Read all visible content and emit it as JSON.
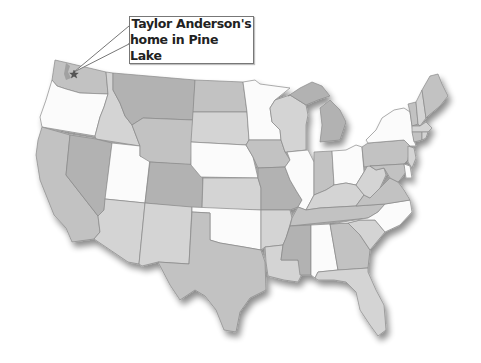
{
  "map": {
    "title": "United States",
    "callout": {
      "line1": "Taylor Anderson's",
      "line2": "home in Pine Lake"
    },
    "marker": {
      "icon": "star-icon",
      "state": "Washington",
      "place": "Pine Lake"
    },
    "shades": {
      "white": "#fbfbfb",
      "light": "#d4d4d4",
      "mid": "#c2c2c2",
      "dark": "#b2b2b2",
      "border": "#8a8a8a"
    },
    "states": [
      {
        "name": "Washington",
        "shade": "mid"
      },
      {
        "name": "Oregon",
        "shade": "white"
      },
      {
        "name": "California",
        "shade": "mid"
      },
      {
        "name": "Idaho",
        "shade": "light"
      },
      {
        "name": "Nevada",
        "shade": "dark"
      },
      {
        "name": "Utah",
        "shade": "white"
      },
      {
        "name": "Arizona",
        "shade": "light"
      },
      {
        "name": "Montana",
        "shade": "dark"
      },
      {
        "name": "Wyoming",
        "shade": "mid"
      },
      {
        "name": "Colorado",
        "shade": "dark"
      },
      {
        "name": "New Mexico",
        "shade": "light"
      },
      {
        "name": "North Dakota",
        "shade": "mid"
      },
      {
        "name": "South Dakota",
        "shade": "light"
      },
      {
        "name": "Nebraska",
        "shade": "white"
      },
      {
        "name": "Kansas",
        "shade": "light"
      },
      {
        "name": "Oklahoma",
        "shade": "white"
      },
      {
        "name": "Texas",
        "shade": "mid"
      },
      {
        "name": "Minnesota",
        "shade": "white"
      },
      {
        "name": "Iowa",
        "shade": "mid"
      },
      {
        "name": "Missouri",
        "shade": "dark"
      },
      {
        "name": "Arkansas",
        "shade": "light"
      },
      {
        "name": "Louisiana",
        "shade": "light"
      },
      {
        "name": "Wisconsin",
        "shade": "light"
      },
      {
        "name": "Illinois",
        "shade": "white"
      },
      {
        "name": "Michigan",
        "shade": "dark"
      },
      {
        "name": "Indiana",
        "shade": "mid"
      },
      {
        "name": "Ohio",
        "shade": "white"
      },
      {
        "name": "Kentucky",
        "shade": "light"
      },
      {
        "name": "Tennessee",
        "shade": "mid"
      },
      {
        "name": "Mississippi",
        "shade": "dark"
      },
      {
        "name": "Alabama",
        "shade": "white"
      },
      {
        "name": "Georgia",
        "shade": "mid"
      },
      {
        "name": "Florida",
        "shade": "light"
      },
      {
        "name": "South Carolina",
        "shade": "light"
      },
      {
        "name": "North Carolina",
        "shade": "white"
      },
      {
        "name": "Virginia",
        "shade": "mid"
      },
      {
        "name": "West Virginia",
        "shade": "light"
      },
      {
        "name": "Pennsylvania",
        "shade": "mid"
      },
      {
        "name": "New York",
        "shade": "white"
      },
      {
        "name": "Vermont",
        "shade": "mid"
      },
      {
        "name": "New Hampshire",
        "shade": "light"
      },
      {
        "name": "Maine",
        "shade": "mid"
      },
      {
        "name": "Massachusetts",
        "shade": "light"
      },
      {
        "name": "Connecticut",
        "shade": "mid"
      },
      {
        "name": "Rhode Island",
        "shade": "light"
      },
      {
        "name": "New Jersey",
        "shade": "light"
      },
      {
        "name": "Delaware",
        "shade": "white"
      },
      {
        "name": "Maryland",
        "shade": "mid"
      }
    ]
  }
}
